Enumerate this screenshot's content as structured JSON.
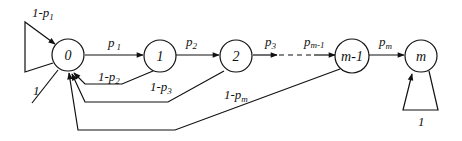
{
  "diagram": {
    "nodes": [
      {
        "id": "0",
        "label": "0"
      },
      {
        "id": "1",
        "label": "1"
      },
      {
        "id": "2",
        "label": "2"
      },
      {
        "id": "m-1",
        "label": "m-1"
      },
      {
        "id": "m",
        "label": "m"
      }
    ],
    "edges": {
      "self_loop_0": {
        "base": "1-p",
        "sub": "1"
      },
      "entry_0": {
        "label": "1"
      },
      "p1": {
        "base": "p",
        "sub": "1"
      },
      "p2": {
        "base": "p",
        "sub": "2"
      },
      "p3": {
        "base": "p",
        "sub": "3"
      },
      "pm1": {
        "base": "p",
        "sub": "m-1"
      },
      "pm": {
        "base": "p",
        "sub": "m"
      },
      "back_1": {
        "base": "1-p",
        "sub": "2"
      },
      "back_2": {
        "base": "1-p",
        "sub": "3"
      },
      "back_m1": {
        "base": "1-p",
        "sub": "m"
      },
      "self_loop_m": {
        "label": "1"
      }
    }
  }
}
